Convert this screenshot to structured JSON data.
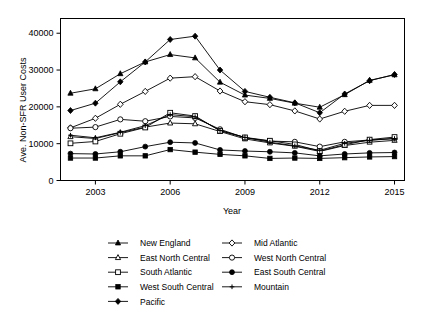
{
  "chart_data": {
    "type": "line",
    "title": "",
    "xlabel": "Year",
    "ylabel": "Ave. Non-SFR User Costs",
    "x": [
      2002,
      2003,
      2004,
      2005,
      2006,
      2007,
      2008,
      2009,
      2010,
      2011,
      2012,
      2013,
      2014,
      2015
    ],
    "xticks": [
      2003,
      2006,
      2009,
      2012,
      2015
    ],
    "yticks": [
      0,
      10000,
      20000,
      30000,
      40000
    ],
    "ytick_labels": [
      "0",
      "10000",
      "20000",
      "30000",
      "40000"
    ],
    "xlim": [
      2001.6,
      2015.4
    ],
    "ylim": [
      0,
      44000
    ],
    "grid": false,
    "legend_position": "below-plot",
    "legend_columns": 2,
    "series": [
      {
        "name": "New England",
        "marker": "filled-triangle",
        "values": [
          23700,
          24900,
          29000,
          32200,
          34200,
          33300,
          26700,
          23200,
          22300,
          21000,
          19900,
          23300,
          27200,
          28700
        ]
      },
      {
        "name": "Mid Atlantic",
        "marker": "open-diamond",
        "values": [
          14300,
          16900,
          20700,
          24200,
          27800,
          28200,
          24300,
          21400,
          20600,
          18900,
          16700,
          18800,
          20400,
          20400
        ]
      },
      {
        "name": "East North Central",
        "marker": "open-triangle",
        "values": [
          11900,
          11400,
          13000,
          14500,
          15600,
          15400,
          13300,
          11300,
          10200,
          9300,
          7900,
          9500,
          10400,
          10900
        ]
      },
      {
        "name": "West North Central",
        "marker": "open-circle",
        "values": [
          14200,
          14500,
          16600,
          16100,
          17400,
          17000,
          13900,
          11600,
          10700,
          10500,
          9200,
          10500,
          11000,
          11400
        ]
      },
      {
        "name": "South Atlantic",
        "marker": "open-square",
        "values": [
          10100,
          10600,
          12700,
          14400,
          18400,
          17500,
          13500,
          11700,
          10800,
          9800,
          8000,
          9700,
          11100,
          11800
        ]
      },
      {
        "name": "East South Central",
        "marker": "filled-circle",
        "values": [
          7300,
          7200,
          7800,
          9200,
          10400,
          10200,
          8300,
          8000,
          7800,
          7500,
          6700,
          7200,
          7500,
          7600
        ]
      },
      {
        "name": "West South Central",
        "marker": "filled-square",
        "values": [
          6100,
          6100,
          6700,
          6700,
          8400,
          7700,
          7100,
          6700,
          6000,
          6100,
          6000,
          6200,
          6400,
          6500
        ]
      },
      {
        "name": "Mountain",
        "marker": "plus",
        "values": [
          12300,
          11600,
          13100,
          14900,
          17900,
          17300,
          13600,
          11700,
          10400,
          9400,
          8200,
          10100,
          10900,
          11400
        ]
      },
      {
        "name": "Pacific",
        "marker": "filled-diamond",
        "values": [
          19000,
          21000,
          26800,
          32200,
          38300,
          39200,
          30000,
          24200,
          22600,
          21100,
          18400,
          23500,
          27100,
          28800
        ]
      }
    ]
  },
  "legend": {
    "entries": [
      {
        "label": "New England",
        "marker": "filled-triangle"
      },
      {
        "label": "Mid Atlantic",
        "marker": "open-diamond"
      },
      {
        "label": "East North Central",
        "marker": "open-triangle"
      },
      {
        "label": "West North Central",
        "marker": "open-circle"
      },
      {
        "label": "South Atlantic",
        "marker": "open-square"
      },
      {
        "label": "East South Central",
        "marker": "filled-circle"
      },
      {
        "label": "West South Central",
        "marker": "filled-square"
      },
      {
        "label": "Mountain",
        "marker": "plus"
      },
      {
        "label": "Pacific",
        "marker": "filled-diamond"
      }
    ]
  },
  "colors": {
    "foreground": "#000000",
    "background": "#ffffff"
  }
}
